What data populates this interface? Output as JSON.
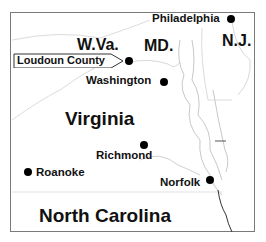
{
  "map": {
    "frame": {
      "border_color": "#7a7a7a",
      "background": "#ffffff"
    },
    "states": [
      {
        "id": "wva",
        "label": "W.Va."
      },
      {
        "id": "md",
        "label": "MD."
      },
      {
        "id": "nj",
        "label": "N.J."
      },
      {
        "id": "va",
        "label": "Virginia"
      },
      {
        "id": "nc",
        "label": "North Carolina"
      }
    ],
    "cities": [
      {
        "id": "philadelphia",
        "label": "Philadelphia"
      },
      {
        "id": "washington",
        "label": "Washington"
      },
      {
        "id": "richmond",
        "label": "Richmond"
      },
      {
        "id": "roanoke",
        "label": "Roanoke"
      },
      {
        "id": "norfolk",
        "label": "Norfolk"
      }
    ],
    "callout": {
      "label": "Loudoun County"
    },
    "colors": {
      "text": "#111111",
      "dot": "#000000",
      "boundary": "#d8d8d8",
      "coast": "#c4c4c4"
    }
  }
}
